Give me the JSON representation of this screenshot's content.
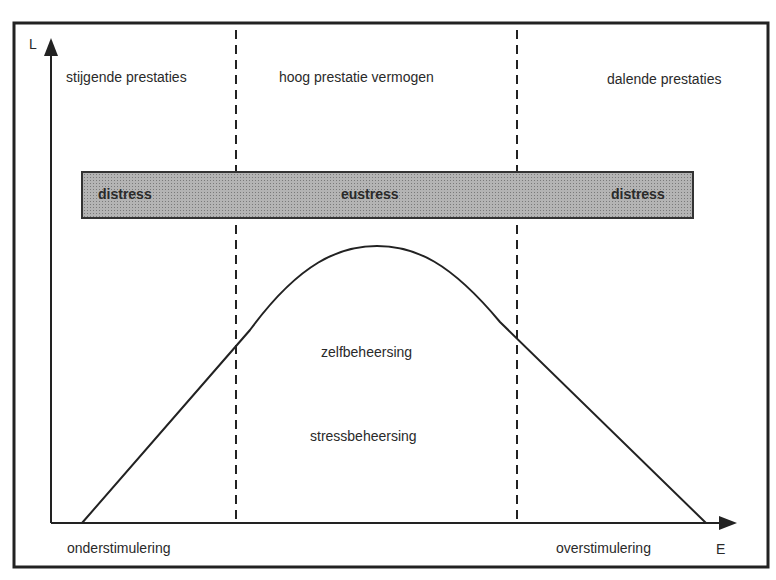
{
  "axes": {
    "y_label": "L",
    "x_label": "E"
  },
  "zones": [
    {
      "label": "stijgende prestaties"
    },
    {
      "label": "hoog prestatie vermogen"
    },
    {
      "label": "dalende prestaties"
    }
  ],
  "band": {
    "color": "#a8a8a8",
    "segments": [
      {
        "label": "distress"
      },
      {
        "label": "eustress"
      },
      {
        "label": "distress"
      }
    ]
  },
  "curve_labels": {
    "upper": "zelfbeheersing",
    "lower": "stressbeheersing"
  },
  "x_ends": {
    "left": "onderstimulering",
    "right": "overstimulering"
  }
}
